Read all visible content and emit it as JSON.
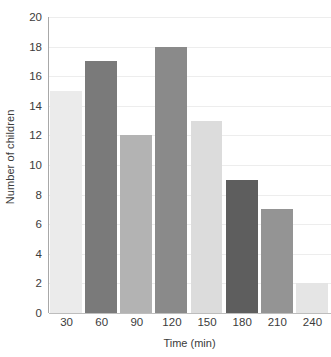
{
  "chart_data": {
    "type": "bar",
    "title": "",
    "xlabel": "Time (min)",
    "ylabel": "Number of children",
    "categories": [
      "30",
      "60",
      "90",
      "120",
      "150",
      "180",
      "210",
      "240"
    ],
    "values": [
      15,
      17,
      12,
      18,
      13,
      9,
      7,
      2
    ],
    "bar_colors": [
      "#ebebeb",
      "#7a7a7a",
      "#b3b3b3",
      "#8a8a8a",
      "#dcdcdc",
      "#5e5e5e",
      "#949494",
      "#e5e5e5"
    ],
    "ylim": [
      0,
      20
    ],
    "ytick_labels": [
      "0",
      "2",
      "4",
      "6",
      "8",
      "10",
      "12",
      "14",
      "16",
      "18",
      "20"
    ],
    "ytick_values": [
      0,
      2,
      4,
      6,
      8,
      10,
      12,
      14,
      16,
      18,
      20
    ],
    "grid": true,
    "grid_axis": "y",
    "grid_color": "#ededed",
    "axis_color": "#a8a8a8",
    "legend": false,
    "legend_position": "none",
    "background_color": "#ffffff",
    "text_color": "#3b3b3b"
  }
}
